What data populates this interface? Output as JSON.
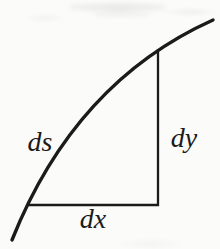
{
  "figure": {
    "labels": {
      "ds": "ds",
      "dy": "dy",
      "dx": "dx"
    }
  },
  "colors": {
    "ink": "#1b1b1b",
    "background": "#fbfbfa",
    "artifact": "#e3e3df"
  }
}
